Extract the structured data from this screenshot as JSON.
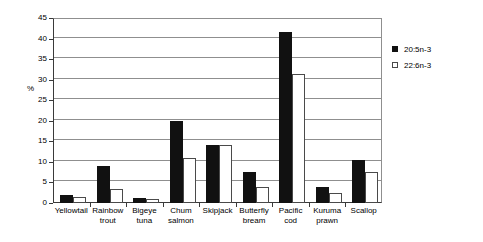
{
  "chart_data": {
    "type": "bar",
    "title": "",
    "xlabel": "",
    "ylabel": "%",
    "ylim": [
      0,
      45
    ],
    "yticks": [
      0,
      5,
      10,
      15,
      20,
      25,
      30,
      35,
      40,
      45
    ],
    "grid": true,
    "legend_position": "right",
    "categories": [
      "Yellowtail",
      "Rainbow trout",
      "Bigeye tuna",
      "Chum salmon",
      "Skipjack",
      "Butterfly bream",
      "Pacific cod",
      "Kuruma prawn",
      "Scallop"
    ],
    "category_lines": [
      [
        "Yellowtail"
      ],
      [
        "Rainbow",
        "trout"
      ],
      [
        "Bigeye",
        "tuna"
      ],
      [
        "Chum",
        "salmon"
      ],
      [
        "Skipjack"
      ],
      [
        "Butterfly",
        "bream"
      ],
      [
        "Pacific",
        "cod"
      ],
      [
        "Kuruma",
        "prawn"
      ],
      [
        "Scallop"
      ]
    ],
    "series": [
      {
        "name": "20:5n-3",
        "color": "#111111",
        "values": [
          2.0,
          9.0,
          1.3,
          20.0,
          14.0,
          7.5,
          41.5,
          4.0,
          10.5
        ]
      },
      {
        "name": "22:6n-3",
        "color": "#ffffff",
        "values": [
          1.5,
          3.5,
          1.0,
          11.0,
          14.0,
          4.0,
          31.5,
          2.5,
          7.5
        ]
      }
    ]
  },
  "legend": {
    "items": [
      {
        "label": "20:5n-3"
      },
      {
        "label": "22:6n-3"
      }
    ]
  },
  "axis": {
    "y_title": "%"
  }
}
